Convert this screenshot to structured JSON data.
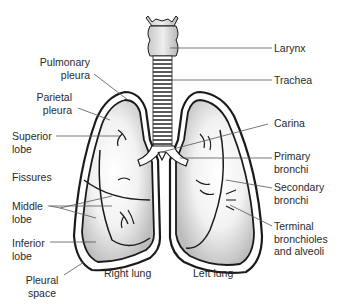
{
  "diagram": {
    "labels_left": {
      "pulmonary_pleura": [
        "Pulmonary",
        "pleura"
      ],
      "parietal_pleura": [
        "Parietal",
        "pleura"
      ],
      "superior_lobe": [
        "Superior",
        "lobe"
      ],
      "fissures": [
        "Fissures"
      ],
      "middle_lobe": [
        "Middle",
        "lobe"
      ],
      "inferior_lobe": [
        "Inferior",
        "lobe"
      ],
      "pleural_space": [
        "Pleural",
        "space"
      ]
    },
    "labels_right": {
      "larynx": [
        "Larynx"
      ],
      "trachea": [
        "Trachea"
      ],
      "carina": [
        "Carina"
      ],
      "primary_bronchi": [
        "Primary",
        "bronchi"
      ],
      "secondary_bronchi": [
        "Secondary",
        "bronchi"
      ],
      "terminal_bronchioles": [
        "Terminal",
        "bronchioles",
        "and alveoli"
      ]
    },
    "captions": {
      "right_lung": "Right lung",
      "left_lung": "Left lung"
    },
    "colors": {
      "outline": "#1a1a1a",
      "leader": "#555555",
      "shade": "#bdbdbd",
      "text": "#2a2a2a"
    }
  }
}
